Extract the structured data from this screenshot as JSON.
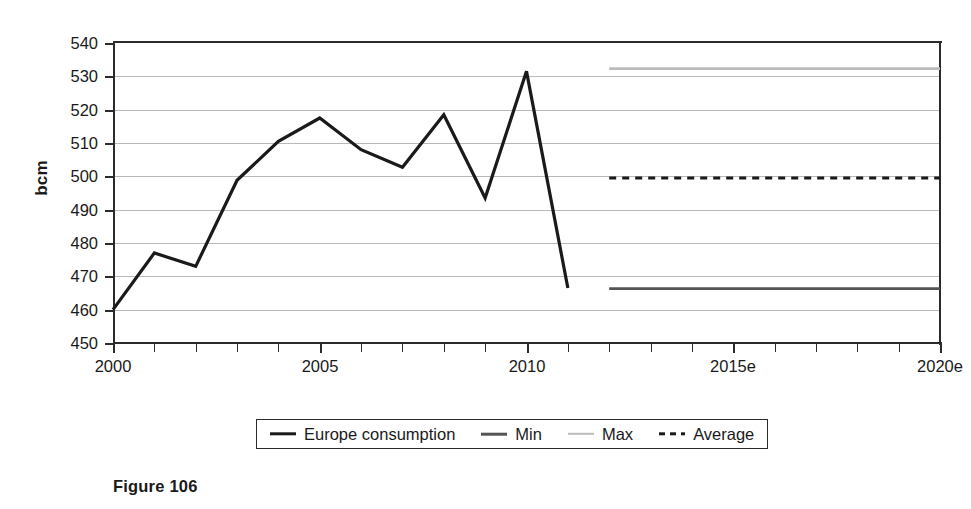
{
  "chart_data": {
    "type": "line",
    "title": "",
    "xlabel": "",
    "ylabel": "bcm",
    "xlim": [
      2000,
      2020
    ],
    "ylim": [
      450,
      540
    ],
    "grid": true,
    "legend_position": "bottom",
    "y_ticks": [
      540,
      530,
      520,
      510,
      500,
      490,
      480,
      470,
      460,
      450
    ],
    "x_ticks": [
      2000,
      2001,
      2002,
      2003,
      2004,
      2005,
      2006,
      2007,
      2008,
      2009,
      2010,
      2011,
      2012,
      2013,
      2014,
      2015,
      2016,
      2017,
      2018,
      2019,
      2020
    ],
    "x_tick_labels": [
      "2000",
      "",
      "",
      "",
      "",
      "2005",
      "",
      "",
      "",
      "",
      "2010",
      "",
      "",
      "",
      "",
      "2015e",
      "",
      "",
      "",
      "",
      "2020e"
    ],
    "series": [
      {
        "name": "Europe consumption",
        "style": "solid",
        "color": "#1a1a1a",
        "width": 3.2,
        "x": [
          2000,
          2001,
          2002,
          2003,
          2004,
          2005,
          2006,
          2007,
          2008,
          2009,
          2010,
          2011
        ],
        "values": [
          460.0,
          477.0,
          473.0,
          498.8,
          510.5,
          517.5,
          508.0,
          502.7,
          518.5,
          493.5,
          531.5,
          466.5
        ]
      },
      {
        "name": "Min",
        "style": "solid",
        "color": "#555555",
        "width": 2.6,
        "x": [
          2012,
          2020
        ],
        "values": [
          466.3,
          466.3
        ]
      },
      {
        "name": "Max",
        "style": "solid",
        "color": "#bbbbbb",
        "width": 2.6,
        "x": [
          2012,
          2020
        ],
        "values": [
          532.3,
          532.3
        ]
      },
      {
        "name": "Average",
        "style": "dashed",
        "color": "#1a1a1a",
        "width": 3.0,
        "x": [
          2012,
          2020
        ],
        "values": [
          499.5,
          499.5
        ]
      }
    ]
  },
  "axis": {
    "y_title": "bcm"
  },
  "legend": {
    "items": [
      {
        "label": "Europe consumption",
        "color": "#1a1a1a",
        "style": "solid",
        "thickness": 3.4
      },
      {
        "label": "Min",
        "color": "#555555",
        "style": "solid",
        "thickness": 2.6
      },
      {
        "label": "Max",
        "color": "#bbbbbb",
        "style": "solid",
        "thickness": 2.4
      },
      {
        "label": "Average",
        "color": "#1a1a1a",
        "style": "dashed",
        "thickness": 3.4
      }
    ]
  },
  "caption": {
    "text": "Figure 106"
  }
}
